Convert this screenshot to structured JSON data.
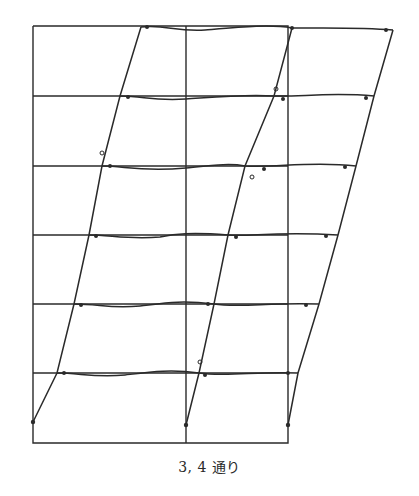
{
  "caption": "3, 4 通り",
  "colors": {
    "line": "#2a2a2a",
    "background": "#ffffff"
  },
  "original_frame": {
    "columns_x": [
      33,
      186,
      288
    ],
    "floors_y": [
      26,
      96,
      166,
      235,
      304,
      373,
      443
    ]
  },
  "deformed_frame": {
    "columns": [
      {
        "name": "left",
        "base": [
          33,
          422
        ],
        "top": [
          118,
          26
        ]
      },
      {
        "name": "middle",
        "base": [
          186,
          425
        ],
        "top": [
          292,
          28
        ]
      },
      {
        "name": "right",
        "base": [
          288,
          425
        ],
        "top": [
          393,
          30
        ]
      }
    ],
    "floor_levels": [
      26,
      96,
      166,
      235,
      304,
      373
    ]
  }
}
